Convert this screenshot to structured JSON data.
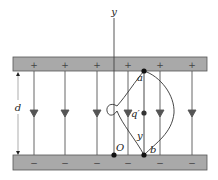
{
  "diagram": {
    "colors": {
      "plate_fill": "#a9a9a9",
      "plate_edge": "#555555",
      "field_line": "#555555",
      "path": "#333333",
      "point": "#111111",
      "text": "#222222"
    },
    "axis": {
      "label": "y"
    },
    "top_plate": {
      "sign": "+",
      "count": 6
    },
    "bottom_plate": {
      "sign": "−",
      "count": 6
    },
    "separation_label": "d",
    "points": {
      "a": "a",
      "b": "b",
      "origin": "O",
      "charge": "q′"
    },
    "path_label": "y",
    "field_direction": "downward (from + plate to − plate)",
    "paths": [
      "straight line a→b",
      "curved path with loop",
      "outward bulging curve on right"
    ]
  }
}
